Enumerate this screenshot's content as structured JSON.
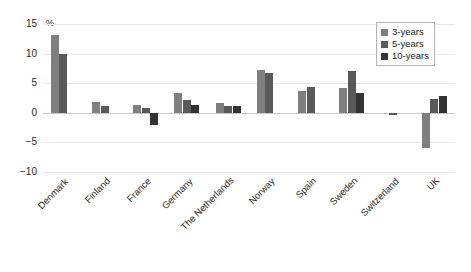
{
  "chart_data": {
    "type": "bar",
    "title": "",
    "xlabel": "",
    "ylabel": "%",
    "ylim": [
      -10,
      15
    ],
    "yticks": [
      15,
      10,
      5,
      0,
      -5,
      -10
    ],
    "ytick_labels": [
      "15",
      "10",
      "5",
      "0",
      "−5",
      "−10"
    ],
    "grid": true,
    "legend_position": "top-right",
    "categories": [
      "Denmark",
      "Finland",
      "France",
      "Germany",
      "The Netherlands",
      "Norway",
      "Spain",
      "Sweden",
      "Switzerland",
      "UK"
    ],
    "series": [
      {
        "name": "3-years",
        "color": "#7f7f7f",
        "values": [
          13.1,
          1.9,
          1.3,
          3.3,
          1.6,
          7.2,
          3.6,
          4.2,
          null,
          -6.0
        ]
      },
      {
        "name": "5-years",
        "color": "#595959",
        "values": [
          9.9,
          1.1,
          0.8,
          2.2,
          1.2,
          6.7,
          4.4,
          7.0,
          -0.3,
          2.3
        ]
      },
      {
        "name": "10-years",
        "color": "#333333",
        "values": [
          null,
          null,
          -2.1,
          1.4,
          1.1,
          null,
          null,
          3.4,
          null,
          2.9
        ]
      }
    ]
  },
  "axis": {
    "unit_label": "%"
  },
  "legend": {
    "items": [
      {
        "label": "3-years",
        "color": "#7f7f7f"
      },
      {
        "label": "5-years",
        "color": "#595959"
      },
      {
        "label": "10-years",
        "color": "#333333"
      }
    ]
  }
}
